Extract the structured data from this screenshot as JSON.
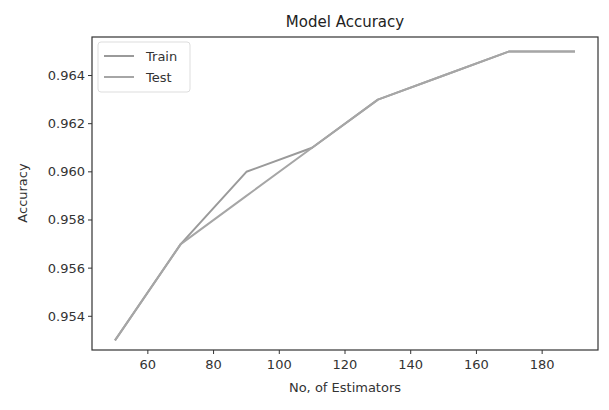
{
  "chart_data": {
    "type": "line",
    "title": "Model Accuracy",
    "xlabel": "No, of Estimators",
    "ylabel": "Accuracy",
    "x": [
      50,
      70,
      90,
      110,
      130,
      150,
      170,
      190
    ],
    "series": [
      {
        "name": "Train",
        "values": [
          0.953,
          0.957,
          0.96,
          0.961,
          0.963,
          0.964,
          0.965,
          0.965
        ],
        "color": "#9a9a9a"
      },
      {
        "name": "Test",
        "values": [
          0.953,
          0.957,
          0.959,
          0.961,
          0.963,
          0.964,
          0.965,
          0.965
        ],
        "color": "#a6a6a6"
      }
    ],
    "xlim": [
      43,
      197
    ],
    "ylim": [
      0.9526,
      0.9656
    ],
    "xticks": [
      60,
      80,
      100,
      120,
      140,
      160,
      180
    ],
    "yticks": [
      0.954,
      0.956,
      0.958,
      0.96,
      0.962,
      0.964
    ],
    "ytick_labels": [
      "0.954",
      "0.956",
      "0.958",
      "0.960",
      "0.962",
      "0.964"
    ],
    "grid": false,
    "legend_position": "upper left"
  }
}
